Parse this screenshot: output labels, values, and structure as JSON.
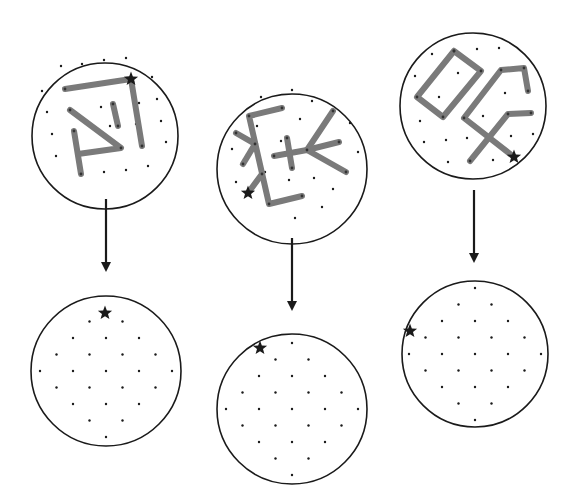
{
  "figure": {
    "description": "Three star-pattern (constellation) circles, each with an arrow pointing down to a dot-lattice circle marking only the star position",
    "colors": {
      "background": "#ffffff",
      "outline": "#1a1a1a",
      "stroke": "#7a7a7a",
      "dot": "#1a1a1a",
      "star": "#1a1a1a"
    },
    "panels": [
      {
        "id": "panel-1",
        "top_circle": {
          "cx": 105,
          "cy": 136,
          "r": 73
        },
        "arrow": {
          "x": 106,
          "y1": 199,
          "y2": 272
        },
        "bottom_circle": {
          "cx": 106,
          "cy": 371,
          "r": 75
        },
        "top_star": {
          "x": 131,
          "y": 79
        },
        "bottom_star": {
          "x": 105,
          "y": 313
        },
        "paths": [
          [
            [
              65,
              89
            ],
            [
              131,
              79
            ],
            [
              142,
              146
            ]
          ],
          [
            [
              113,
              104
            ],
            [
              118,
              126
            ]
          ],
          [
            [
              70,
              110
            ],
            [
              121,
              148
            ],
            [
              78,
              154
            ]
          ],
          [
            [
              74,
              131
            ],
            [
              81,
              174
            ]
          ]
        ],
        "top_dots": [
          [
            61,
            66
          ],
          [
            82,
            64
          ],
          [
            104,
            60
          ],
          [
            126,
            58
          ],
          [
            42,
            91
          ],
          [
            152,
            77
          ],
          [
            47,
            112
          ],
          [
            101,
            107
          ],
          [
            157,
            99
          ],
          [
            52,
            134
          ],
          [
            161,
            121
          ],
          [
            56,
            156
          ],
          [
            166,
            142
          ],
          [
            104,
            172
          ],
          [
            126,
            170
          ],
          [
            148,
            166
          ],
          [
            77,
            150
          ],
          [
            95,
            128
          ],
          [
            87,
            85
          ],
          [
            108,
            83
          ],
          [
            139,
            103
          ],
          [
            136,
            124
          ],
          [
            103,
            150
          ],
          [
            110,
            126
          ]
        ],
        "bottom_dots_grid": {
          "cx": 106,
          "cy": 371,
          "dx": 33,
          "dy": 16.5,
          "r": 70
        }
      },
      {
        "id": "panel-2",
        "top_circle": {
          "cx": 292,
          "cy": 169,
          "r": 75
        },
        "arrow": {
          "x": 292,
          "y1": 238,
          "y2": 311
        },
        "bottom_circle": {
          "cx": 292,
          "cy": 409,
          "r": 75
        },
        "top_star": {
          "x": 248,
          "y": 193
        },
        "bottom_star": {
          "x": 260,
          "y": 348
        },
        "paths": [
          [
            [
              282,
              108
            ],
            [
              249,
              116
            ],
            [
              269,
              204
            ],
            [
              302,
              196
            ]
          ],
          [
            [
              236,
              133
            ],
            [
              255,
              144
            ]
          ],
          [
            [
              243,
              164
            ],
            [
              255,
              144
            ]
          ],
          [
            [
              262,
              174
            ],
            [
              248,
              193
            ]
          ],
          [
            [
              274,
              156
            ],
            [
              307,
              150
            ]
          ],
          [
            [
              287,
              138
            ],
            [
              292,
              168
            ]
          ],
          [
            [
              307,
              150
            ],
            [
              333,
              111
            ]
          ],
          [
            [
              307,
              150
            ],
            [
              339,
              142
            ]
          ],
          [
            [
              307,
              150
            ],
            [
              346,
              172
            ]
          ]
        ],
        "top_dots": [
          [
            261,
            97
          ],
          [
            292,
            90
          ],
          [
            312,
            101
          ],
          [
            232,
            149
          ],
          [
            236,
            182
          ],
          [
            257,
            126
          ],
          [
            300,
            119
          ],
          [
            350,
            123
          ],
          [
            358,
            152
          ],
          [
            281,
            141
          ],
          [
            320,
            133
          ],
          [
            289,
            180
          ],
          [
            314,
            178
          ],
          [
            333,
            189
          ],
          [
            322,
            207
          ],
          [
            295,
            218
          ],
          [
            265,
            172
          ]
        ],
        "bottom_dots_grid": {
          "cx": 292,
          "cy": 409,
          "dx": 33,
          "dy": 16.5,
          "r": 70
        }
      },
      {
        "id": "panel-3",
        "top_circle": {
          "cx": 473,
          "cy": 106,
          "r": 73
        },
        "arrow": {
          "x": 474,
          "y1": 190,
          "y2": 263
        },
        "bottom_circle": {
          "cx": 475,
          "cy": 354,
          "r": 73
        },
        "top_star": {
          "x": 514,
          "y": 157
        },
        "bottom_star": {
          "x": 410,
          "y": 331
        },
        "paths": [
          [
            [
              454,
              51
            ],
            [
              481,
              71
            ],
            [
              443,
              117
            ],
            [
              417,
              97
            ],
            [
              454,
              51
            ]
          ],
          [
            [
              514,
              157
            ],
            [
              464,
              118
            ],
            [
              501,
              70
            ],
            [
              524,
              68
            ],
            [
              528,
              91
            ]
          ],
          [
            [
              470,
              161
            ],
            [
              508,
              114
            ],
            [
              531,
              113
            ]
          ]
        ],
        "top_dots": [
          [
            432,
            54
          ],
          [
            477,
            49
          ],
          [
            499,
            48
          ],
          [
            415,
            76
          ],
          [
            458,
            73
          ],
          [
            439,
            97
          ],
          [
            420,
            121
          ],
          [
            424,
            142
          ],
          [
            446,
            140
          ],
          [
            467,
            138
          ],
          [
            448,
            162
          ],
          [
            493,
            160
          ],
          [
            483,
            116
          ],
          [
            505,
            93
          ],
          [
            511,
            136
          ],
          [
            533,
            134
          ]
        ],
        "bottom_dots_grid": {
          "cx": 475,
          "cy": 354,
          "dx": 33,
          "dy": 16.5,
          "r": 68
        }
      }
    ]
  }
}
